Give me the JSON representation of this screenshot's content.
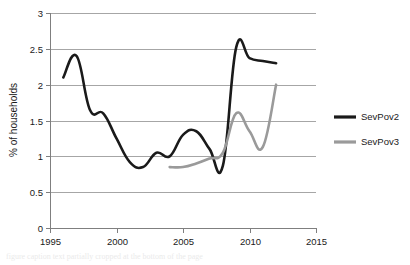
{
  "chart_data": {
    "type": "line",
    "title": "",
    "subtitle": "",
    "xlabel": "",
    "ylabel": "% of households",
    "xlim": [
      1995,
      2015
    ],
    "ylim": [
      0,
      3
    ],
    "grid": true,
    "grid_axis": "y",
    "legend_position": "right",
    "x_ticks": [
      1995,
      2000,
      2005,
      2010,
      2015
    ],
    "x_tick_labels": [
      "1995",
      "2000",
      "2005",
      "2010",
      "2015"
    ],
    "y_ticks": [
      0,
      0.5,
      1,
      1.5,
      2,
      2.5,
      3
    ],
    "y_tick_labels": [
      "0",
      "0.5",
      "1",
      "1.5",
      "2",
      "2.5",
      "3"
    ],
    "series": [
      {
        "name": "SevPov2",
        "color": "#1a1a1a",
        "width": 2.6,
        "x": [
          1996,
          1997,
          1998,
          1999,
          2000,
          2001,
          2002,
          2003,
          2004,
          2005,
          2006,
          2007,
          2008,
          2009,
          2010,
          2011,
          2012
        ],
        "values": [
          2.1,
          2.4,
          1.65,
          1.6,
          1.25,
          0.92,
          0.85,
          1.05,
          1.0,
          1.3,
          1.35,
          1.1,
          0.87,
          2.52,
          2.37,
          2.33,
          2.3
        ]
      },
      {
        "name": "SevPov3",
        "color": "#9a9a9a",
        "width": 2.6,
        "x": [
          2004,
          2005,
          2006,
          2007,
          2008,
          2009,
          2010,
          2011,
          2012
        ],
        "values": [
          0.85,
          0.85,
          0.9,
          0.97,
          1.05,
          1.6,
          1.35,
          1.13,
          2.0
        ]
      }
    ],
    "legend": [
      {
        "label": "SevPov2",
        "color": "#1a1a1a"
      },
      {
        "label": "SevPov3",
        "color": "#9a9a9a"
      }
    ],
    "annotations": []
  },
  "page": {
    "bleed_text": "figure caption text partially cropped at the bottom of the page"
  }
}
